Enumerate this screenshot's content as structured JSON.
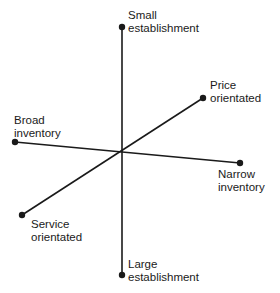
{
  "diagram": {
    "type": "positioning-map",
    "line_color": "#1a1a1a",
    "center": {
      "x": 122,
      "y": 152
    },
    "axes": [
      {
        "name": "establishment-size",
        "start": {
          "x": 122,
          "y": 27,
          "label_lines": [
            "Small",
            "establishment"
          ]
        },
        "end": {
          "x": 122,
          "y": 275,
          "label_lines": [
            "Large",
            "establishment"
          ]
        }
      },
      {
        "name": "inventory-breadth",
        "start": {
          "x": 15,
          "y": 142,
          "label_lines": [
            "Broad",
            "inventory"
          ]
        },
        "end": {
          "x": 240,
          "y": 163,
          "label_lines": [
            "Narrow",
            "inventory"
          ]
        }
      },
      {
        "name": "orientation",
        "start": {
          "x": 203,
          "y": 98,
          "label_lines": [
            "Price",
            "orientated"
          ]
        },
        "end": {
          "x": 22,
          "y": 215,
          "label_lines": [
            "Service",
            "orientated"
          ]
        }
      }
    ]
  },
  "labels": {
    "small_establishment": {
      "line1": "Small",
      "line2": "establishment"
    },
    "large_establishment": {
      "line1": "Large",
      "line2": "establishment"
    },
    "broad_inventory": {
      "line1": "Broad",
      "line2": "inventory"
    },
    "narrow_inventory": {
      "line1": "Narrow",
      "line2": "inventory"
    },
    "price_orientated": {
      "line1": "Price",
      "line2": "orientated"
    },
    "service_orientated": {
      "line1": "Service",
      "line2": "orientated"
    }
  }
}
